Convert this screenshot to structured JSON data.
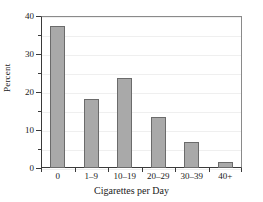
{
  "chart_data": {
    "type": "bar",
    "title": "",
    "xlabel": "Cigarettes per Day",
    "ylabel": "Percent",
    "categories": [
      "0",
      "1–9",
      "10–19",
      "20–29",
      "30–39",
      "40+"
    ],
    "values": [
      37.5,
      18.2,
      23.7,
      13.4,
      6.8,
      1.6
    ],
    "ylim": [
      0,
      40
    ],
    "y_ticks": [
      0,
      10,
      20,
      30,
      40
    ],
    "y_tick_labels": [
      "0",
      "10",
      "20",
      "30",
      "40"
    ],
    "y_minor_ticks": [
      5,
      15,
      25,
      35
    ],
    "grid": true,
    "legend": "none",
    "bar_color": "#a9a9a9",
    "bar_edge_color": "#6b6b6b",
    "axis_color": "#3a3a3a",
    "grid_color": "#efefef",
    "background_color": "#ffffff"
  }
}
